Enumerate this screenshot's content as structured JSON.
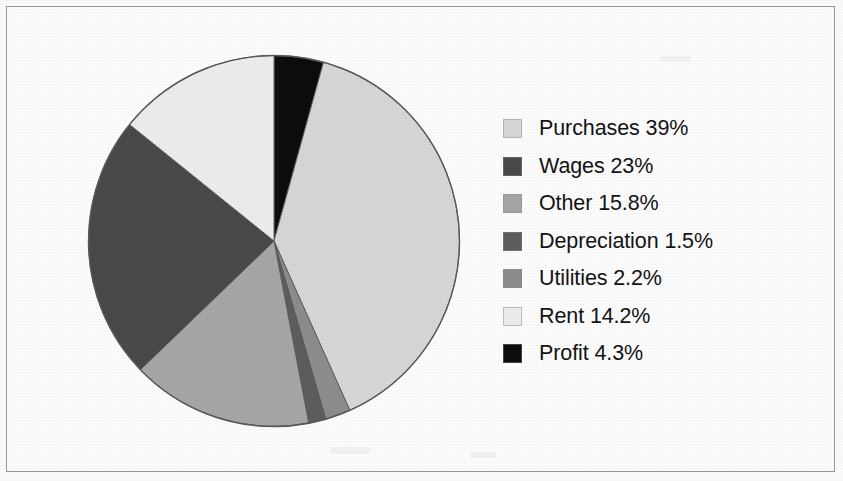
{
  "chart_data": {
    "type": "pie",
    "title": "",
    "labels": [
      "Purchases",
      "Wages",
      "Other",
      "Depreciation",
      "Utilities",
      "Rent",
      "Profit"
    ],
    "values": [
      39,
      23,
      15.8,
      1.5,
      2.2,
      14.2,
      4.3
    ],
    "value_unit": "%",
    "legend_position": "right",
    "grid": false,
    "start_angle_deg": 0,
    "direction": "clockwise",
    "slice_order_clockwise_from_top": [
      "Profit",
      "Purchases",
      "Utilities",
      "Depreciation",
      "Other",
      "Wages",
      "Rent"
    ],
    "colors": {
      "Purchases": "#d9d9d9",
      "Wages": "#4a4a4a",
      "Other": "#a8a8a8",
      "Depreciation": "#5e5e5e",
      "Utilities": "#8e8e8e",
      "Rent": "#efefef",
      "Profit": "#0d0d0d"
    },
    "outline_color": "#5a5a5a"
  },
  "legend": {
    "items": [
      {
        "label": "Purchases 39%",
        "name": "Purchases",
        "value": "39%",
        "color": "#d9d9d9"
      },
      {
        "label": "Wages 23%",
        "name": "Wages",
        "value": "23%",
        "color": "#4a4a4a"
      },
      {
        "label": "Other 15.8%",
        "name": "Other",
        "value": "15.8%",
        "color": "#a8a8a8"
      },
      {
        "label": "Depreciation 1.5%",
        "name": "Depreciation",
        "value": "1.5%",
        "color": "#5e5e5e"
      },
      {
        "label": "Utilities 2.2%",
        "name": "Utilities",
        "value": "2.2%",
        "color": "#8e8e8e"
      },
      {
        "label": "Rent 14.2%",
        "name": "Rent",
        "value": "14.2%",
        "color": "#efefef"
      },
      {
        "label": "Profit 4.3%",
        "name": "Profit",
        "value": "4.3%",
        "color": "#0d0d0d"
      }
    ]
  }
}
